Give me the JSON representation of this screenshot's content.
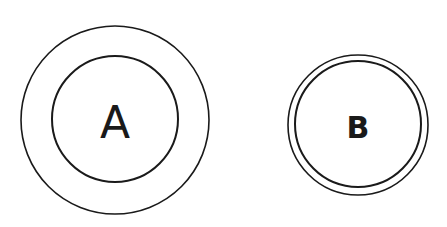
{
  "diagram": {
    "circles": [
      {
        "label": "A",
        "center": [
          115,
          120
        ],
        "outer_radius": 94,
        "inner_radius": 63,
        "stroke": "#1a1a1a"
      },
      {
        "label": "B",
        "center": [
          358,
          125
        ],
        "outer_radius": 70,
        "inner_radius": 63,
        "stroke": "#1a1a1a"
      }
    ]
  }
}
